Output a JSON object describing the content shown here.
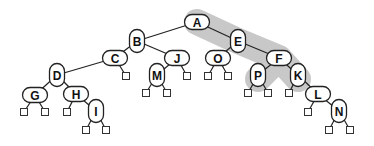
{
  "diagram": {
    "type": "binary-tree",
    "highlight": {
      "color": "#c8c8c8",
      "path_nodes": [
        "A",
        "E",
        "F"
      ],
      "branches": [
        [
          "F",
          "P"
        ],
        [
          "F",
          "K"
        ]
      ]
    },
    "nodes": [
      {
        "id": "A",
        "label": "A",
        "x": 197,
        "y": 22,
        "shape": "h"
      },
      {
        "id": "B",
        "label": "B",
        "x": 137,
        "y": 41,
        "shape": "v"
      },
      {
        "id": "E",
        "label": "E",
        "x": 238,
        "y": 41,
        "shape": "v"
      },
      {
        "id": "C",
        "label": "C",
        "x": 115,
        "y": 58,
        "shape": "h"
      },
      {
        "id": "J",
        "label": "J",
        "x": 177,
        "y": 58,
        "shape": "h"
      },
      {
        "id": "O",
        "label": "O",
        "x": 218,
        "y": 58,
        "shape": "h"
      },
      {
        "id": "F",
        "label": "F",
        "x": 279,
        "y": 58,
        "shape": "h"
      },
      {
        "id": "D",
        "label": "D",
        "x": 57,
        "y": 75,
        "shape": "v"
      },
      {
        "id": "M",
        "label": "M",
        "x": 157,
        "y": 75,
        "shape": "v"
      },
      {
        "id": "P",
        "label": "P",
        "x": 258,
        "y": 75,
        "shape": "v"
      },
      {
        "id": "K",
        "label": "K",
        "x": 298,
        "y": 75,
        "shape": "v"
      },
      {
        "id": "G",
        "label": "G",
        "x": 35,
        "y": 95,
        "shape": "h"
      },
      {
        "id": "H",
        "label": "H",
        "x": 76,
        "y": 94,
        "shape": "h"
      },
      {
        "id": "L",
        "label": "L",
        "x": 318,
        "y": 94,
        "shape": "h"
      },
      {
        "id": "I",
        "label": "I",
        "x": 96,
        "y": 111,
        "shape": "v"
      },
      {
        "id": "N",
        "label": "N",
        "x": 339,
        "y": 111,
        "shape": "v"
      }
    ],
    "edges": [
      [
        "A",
        "B"
      ],
      [
        "A",
        "E"
      ],
      [
        "B",
        "C"
      ],
      [
        "B",
        "J"
      ],
      [
        "E",
        "O"
      ],
      [
        "E",
        "F"
      ],
      [
        "C",
        "D"
      ],
      [
        "J",
        "M"
      ],
      [
        "F",
        "P"
      ],
      [
        "F",
        "K"
      ],
      [
        "D",
        "G"
      ],
      [
        "D",
        "H"
      ],
      [
        "H",
        "I"
      ],
      [
        "K",
        "L"
      ],
      [
        "L",
        "N"
      ]
    ],
    "leaves": [
      {
        "parent": "C",
        "x": 126,
        "y": 76
      },
      {
        "parent": "J",
        "x": 187,
        "y": 76
      },
      {
        "parent": "O",
        "x": 208,
        "y": 76
      },
      {
        "parent": "O",
        "x": 228,
        "y": 76
      },
      {
        "parent": "M",
        "x": 146,
        "y": 93
      },
      {
        "parent": "M",
        "x": 167,
        "y": 93
      },
      {
        "parent": "P",
        "x": 248,
        "y": 93
      },
      {
        "parent": "P",
        "x": 268,
        "y": 93
      },
      {
        "parent": "K",
        "x": 289,
        "y": 93
      },
      {
        "parent": "G",
        "x": 24,
        "y": 112
      },
      {
        "parent": "G",
        "x": 45,
        "y": 112
      },
      {
        "parent": "H",
        "x": 67,
        "y": 112
      },
      {
        "parent": "L",
        "x": 308,
        "y": 112
      },
      {
        "parent": "I",
        "x": 86,
        "y": 130
      },
      {
        "parent": "I",
        "x": 106,
        "y": 130
      },
      {
        "parent": "N",
        "x": 329,
        "y": 130
      },
      {
        "parent": "N",
        "x": 350,
        "y": 130
      }
    ]
  }
}
